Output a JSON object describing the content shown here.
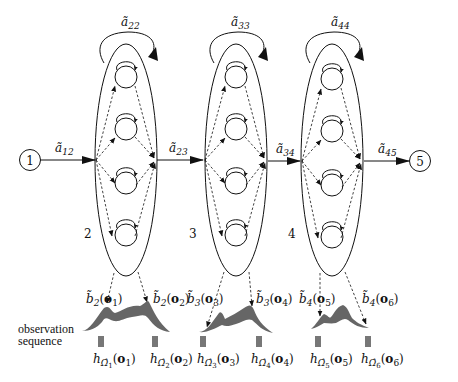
{
  "figure": {
    "type": "segmental HMM / trajectory state diagram",
    "colors": {
      "line": "#111111",
      "density_fill": "#666666",
      "symbol_fill": "#777777",
      "background": "#ffffff"
    },
    "entry_node": {
      "label": "1"
    },
    "exit_node": {
      "label": "5"
    },
    "macro_states": [
      {
        "label": "2",
        "self_loop": {
          "sym": "ã",
          "sub": "22"
        },
        "inner_states": 4
      },
      {
        "label": "3",
        "self_loop": {
          "sym": "ã",
          "sub": "33"
        },
        "inner_states": 4
      },
      {
        "label": "4",
        "self_loop": {
          "sym": "ã",
          "sub": "44"
        },
        "inner_states": 4
      }
    ],
    "transitions": [
      {
        "sym": "ã",
        "sub": "12"
      },
      {
        "sym": "ã",
        "sub": "23"
      },
      {
        "sym": "ã",
        "sub": "34"
      },
      {
        "sym": "ã",
        "sub": "45"
      }
    ],
    "emissions": [
      {
        "sym": "b̃",
        "sub": "2",
        "arg": "o",
        "arg_sub": "1"
      },
      {
        "sym": "b̃",
        "sub": "2",
        "arg": "o",
        "arg_sub": "2"
      },
      {
        "sym": "b̃",
        "sub": "3",
        "arg": "o",
        "arg_sub": "3"
      },
      {
        "sym": "b̃",
        "sub": "3",
        "arg": "o",
        "arg_sub": "4"
      },
      {
        "sym": "b̃",
        "sub": "4",
        "arg": "o",
        "arg_sub": "5"
      },
      {
        "sym": "b̃",
        "sub": "4",
        "arg": "o",
        "arg_sub": "6"
      }
    ],
    "observation_label": {
      "line1": "observation",
      "line2": "sequence"
    },
    "observations": [
      {
        "sym": "h",
        "sub": "Ω̂",
        "subsub": "1",
        "arg": "o",
        "arg_sub": "1"
      },
      {
        "sym": "h",
        "sub": "Ω̂",
        "subsub": "2",
        "arg": "o",
        "arg_sub": "2"
      },
      {
        "sym": "h",
        "sub": "Ω̂",
        "subsub": "3",
        "arg": "o",
        "arg_sub": "3"
      },
      {
        "sym": "h",
        "sub": "Ω̂",
        "subsub": "4",
        "arg": "o",
        "arg_sub": "4"
      },
      {
        "sym": "h",
        "sub": "Ω̂",
        "subsub": "5",
        "arg": "o",
        "arg_sub": "5"
      },
      {
        "sym": "h",
        "sub": "Ω̂",
        "subsub": "6",
        "arg": "o",
        "arg_sub": "6"
      }
    ]
  }
}
